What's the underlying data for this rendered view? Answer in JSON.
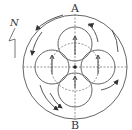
{
  "diagram": {
    "labels": {
      "top": "A",
      "bottom": "B",
      "north": "N"
    },
    "elements": {
      "outer_circle": "outer circle",
      "inner_circles": [
        "top",
        "left",
        "right",
        "bottom"
      ],
      "dashed_circle": "dashed circle",
      "center_dot": "center point",
      "arrows_in_circles": "upward arrows",
      "curved_arrows": "circulation arrows"
    },
    "colors": {
      "line": "#444444",
      "background": "#ffffff"
    }
  }
}
